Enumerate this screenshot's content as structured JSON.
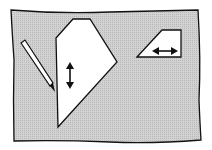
{
  "diagram": {
    "colors": {
      "background": "#ffffff",
      "sheet_fill": "#c8c8c8",
      "shape_fill": "#ffffff",
      "stroke": "#111111"
    },
    "elements": [
      {
        "id": "sheet",
        "type": "rectangle"
      },
      {
        "id": "pencil",
        "type": "pencil"
      },
      {
        "id": "pentagon",
        "type": "polygon",
        "arrow": "vertical-double-arrow"
      },
      {
        "id": "trapezoid",
        "type": "polygon",
        "arrow": "horizontal-double-arrow"
      }
    ]
  }
}
